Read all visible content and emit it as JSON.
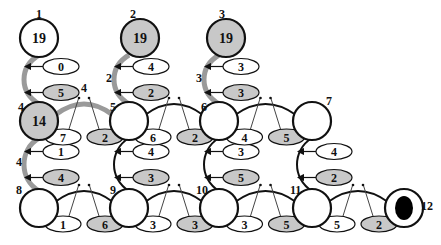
{
  "colors": {
    "gray_fill": "#c8c8c8",
    "white_fill": "#ffffff",
    "stroke": "#111111",
    "gray_edge": "#9a9a9a",
    "sink_fill": "#000000"
  },
  "nodes": [
    {
      "id": "1",
      "label": "1",
      "value": "19",
      "x": 39,
      "y": 38,
      "fill": "white",
      "lx": 36,
      "ly": 18
    },
    {
      "id": "2",
      "label": "2",
      "value": "19",
      "x": 140,
      "y": 38,
      "fill": "gray",
      "lx": 130,
      "ly": 18
    },
    {
      "id": "3",
      "label": "3",
      "value": "19",
      "x": 226,
      "y": 38,
      "fill": "gray",
      "lx": 219,
      "ly": 18
    },
    {
      "id": "4",
      "label": "4",
      "value": "14",
      "x": 39,
      "y": 121,
      "fill": "gray",
      "lx": 18,
      "ly": 111
    },
    {
      "id": "5",
      "label": "5",
      "value": "",
      "x": 129,
      "y": 121,
      "fill": "white",
      "lx": 110,
      "ly": 111
    },
    {
      "id": "6",
      "label": "6",
      "value": "",
      "x": 219,
      "y": 121,
      "fill": "white",
      "lx": 201,
      "ly": 111
    },
    {
      "id": "7",
      "label": "7",
      "value": "",
      "x": 312,
      "y": 121,
      "fill": "white",
      "lx": 326,
      "ly": 105
    },
    {
      "id": "8",
      "label": "8",
      "value": "",
      "x": 39,
      "y": 208,
      "fill": "white",
      "lx": 16,
      "ly": 194
    },
    {
      "id": "9",
      "label": "9",
      "value": "",
      "x": 129,
      "y": 208,
      "fill": "white",
      "lx": 110,
      "ly": 194
    },
    {
      "id": "10",
      "label": "10",
      "value": "",
      "x": 219,
      "y": 208,
      "fill": "white",
      "lx": 196,
      "ly": 194
    },
    {
      "id": "11",
      "label": "11",
      "value": "",
      "x": 312,
      "y": 208,
      "fill": "white",
      "lx": 290,
      "ly": 194
    },
    {
      "id": "12",
      "label": "12",
      "value": "",
      "x": 404,
      "y": 208,
      "fill": "sink",
      "lx": 421,
      "ly": 210
    }
  ],
  "vertical_edges": [
    {
      "from": "1",
      "to": "4",
      "style": "gray",
      "weight": "",
      "wx": 0,
      "wy": 0,
      "top": "0",
      "bottom": "5",
      "x": 39,
      "y1": 38,
      "y2": 121
    },
    {
      "from": "2",
      "to": "5",
      "style": "gray",
      "weight": "2",
      "wx": 106,
      "wy": 82,
      "top": "4",
      "bottom": "2",
      "x": 129,
      "y1": 38,
      "y2": 121
    },
    {
      "from": "3",
      "to": "6",
      "style": "gray",
      "weight": "3",
      "wx": 196,
      "wy": 82,
      "top": "3",
      "bottom": "3",
      "x": 219,
      "y1": 38,
      "y2": 121
    },
    {
      "from": "4",
      "to": "8",
      "style": "gray",
      "weight": "4",
      "wx": 16,
      "wy": 166,
      "top": "1",
      "bottom": "4",
      "x": 39,
      "y1": 121,
      "y2": 208
    },
    {
      "from": "5",
      "to": "9",
      "style": "black",
      "weight": "",
      "wx": 0,
      "wy": 0,
      "top": "4",
      "bottom": "3",
      "x": 129,
      "y1": 121,
      "y2": 208
    },
    {
      "from": "6",
      "to": "10",
      "style": "black",
      "weight": "",
      "wx": 0,
      "wy": 0,
      "top": "3",
      "bottom": "5",
      "x": 219,
      "y1": 121,
      "y2": 208
    },
    {
      "from": "7",
      "to": "11",
      "style": "black",
      "weight": "",
      "wx": 0,
      "wy": 0,
      "top": "4",
      "bottom": "2",
      "x": 312,
      "y1": 121,
      "y2": 208
    }
  ],
  "horizontal_edges": [
    {
      "from": "4",
      "to": "5",
      "style": "gray",
      "weight": "4",
      "left": "7",
      "right": "2",
      "x1": 39,
      "x2": 129,
      "y": 121
    },
    {
      "from": "5",
      "to": "6",
      "style": "black",
      "weight": "",
      "left": "6",
      "right": "2",
      "x1": 129,
      "x2": 219,
      "y": 121
    },
    {
      "from": "6",
      "to": "7",
      "style": "black",
      "weight": "",
      "left": "4",
      "right": "5",
      "x1": 219,
      "x2": 312,
      "y": 121
    },
    {
      "from": "8",
      "to": "9",
      "style": "black",
      "weight": "",
      "left": "1",
      "right": "6",
      "x1": 39,
      "x2": 129,
      "y": 208
    },
    {
      "from": "9",
      "to": "10",
      "style": "black",
      "weight": "",
      "left": "3",
      "right": "3",
      "x1": 129,
      "x2": 219,
      "y": 208
    },
    {
      "from": "10",
      "to": "11",
      "style": "black",
      "weight": "",
      "left": "3",
      "right": "5",
      "x1": 219,
      "x2": 312,
      "y": 208
    },
    {
      "from": "11",
      "to": "12",
      "style": "black",
      "weight": "",
      "left": "5",
      "right": "2",
      "x1": 312,
      "x2": 404,
      "y": 208
    }
  ]
}
